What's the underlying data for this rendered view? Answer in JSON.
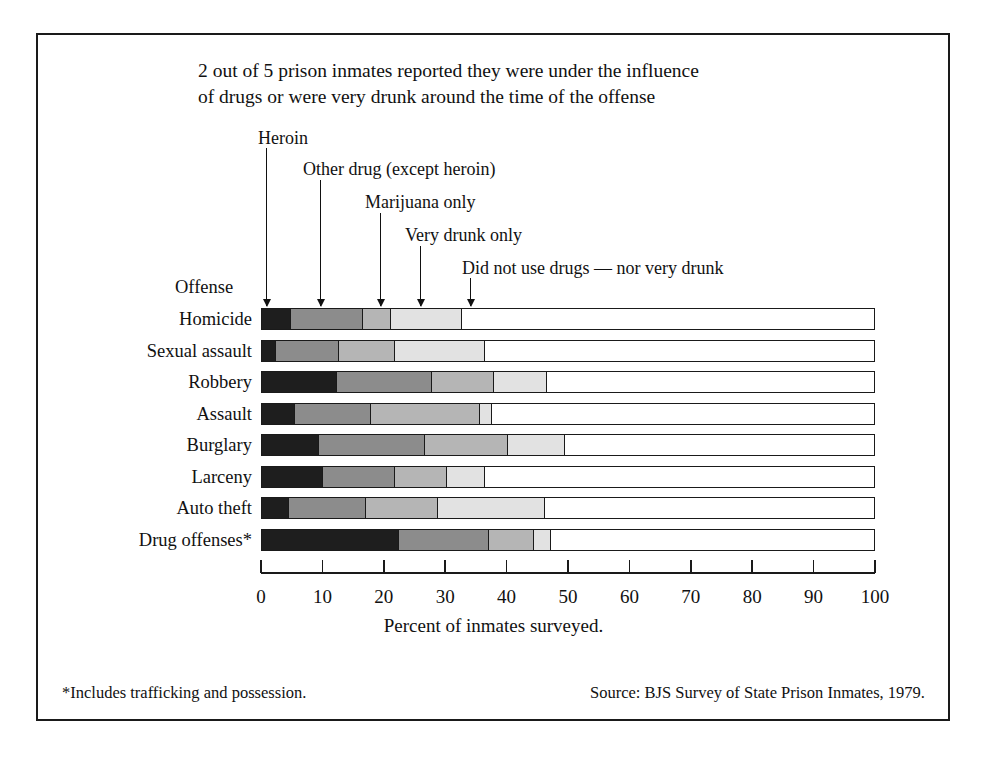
{
  "title_lines": [
    "2 out of 5 prison inmates reported they were under the influence",
    "of drugs or were very drunk around the time of the offense"
  ],
  "axis_head_label": "Offense",
  "xlabel": "Percent of inmates surveyed.",
  "footnote": "*Includes trafficking and possession.",
  "source": "Source:  BJS Survey of State Prison Inmates, 1979.",
  "callouts": [
    {
      "label": "Heroin",
      "left": 258,
      "top": 128,
      "arrow_x": 266,
      "arrow_top": 148,
      "arrow_h": 158
    },
    {
      "label": "Other drug (except heroin)",
      "left": 303,
      "top": 159,
      "arrow_x": 320,
      "arrow_top": 180,
      "arrow_h": 126
    },
    {
      "label": "Marijuana only",
      "left": 365,
      "top": 192,
      "arrow_x": 380,
      "arrow_top": 213,
      "arrow_h": 93
    },
    {
      "label": "Very drunk only",
      "left": 405,
      "top": 225,
      "arrow_x": 420,
      "arrow_top": 246,
      "arrow_h": 60
    },
    {
      "label": "Did not use drugs — nor very drunk",
      "left": 462,
      "top": 258,
      "arrow_x": 470,
      "arrow_top": 278,
      "arrow_h": 28
    }
  ],
  "chart_data": {
    "type": "bar",
    "orientation": "horizontal",
    "stacked": true,
    "title": "2 out of 5 prison inmates reported they were under the influence of drugs or were very drunk around the time of the offense",
    "xlabel": "Percent of inmates surveyed.",
    "ylabel": "Offense",
    "xlim": [
      0,
      100
    ],
    "xticks": [
      0,
      10,
      20,
      30,
      40,
      50,
      60,
      70,
      80,
      90,
      100
    ],
    "grid": false,
    "legend_position": "callout-arrows-above-plot",
    "series": [
      {
        "name": "Heroin",
        "color": "#1e1e1e"
      },
      {
        "name": "Other drug (except heroin)",
        "color": "#8c8c8c"
      },
      {
        "name": "Marijuana only",
        "color": "#b5b5b5"
      },
      {
        "name": "Very drunk only",
        "color": "#e2e2e2"
      },
      {
        "name": "Did not use drugs — nor very drunk",
        "color": "#ffffff"
      }
    ],
    "categories": [
      "Homicide",
      "Sexual assault",
      "Robbery",
      "Assault",
      "Burglary",
      "Larceny",
      "Auto theft",
      "Drug offenses*"
    ],
    "values": [
      [
        4.5,
        11.9,
        4.6,
        11.5,
        67.5
      ],
      [
        2.2,
        10.2,
        9.1,
        14.7,
        63.8
      ],
      [
        12.1,
        15.5,
        10.2,
        8.6,
        53.6
      ],
      [
        5.2,
        12.5,
        17.7,
        2.1,
        62.5
      ],
      [
        9.1,
        17.4,
        13.5,
        9.3,
        50.7
      ],
      [
        9.8,
        11.8,
        8.5,
        6.1,
        63.8
      ],
      [
        4.3,
        12.6,
        11.7,
        17.5,
        53.9
      ],
      [
        22.3,
        14.7,
        7.3,
        2.8,
        52.9
      ]
    ]
  }
}
